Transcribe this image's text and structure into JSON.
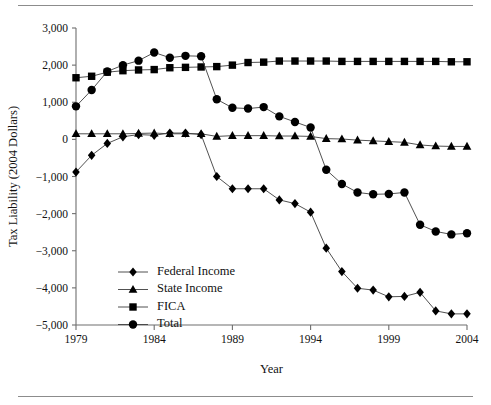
{
  "figure": {
    "kind": "line-chart-figure",
    "background_color": "#ffffff",
    "ink_color": "#000000",
    "line_color": "#3d3d3d",
    "axis_color": "#6e6e6e",
    "rule_color": "#8c8c8c"
  },
  "chart_data": {
    "type": "line",
    "title": "",
    "xlabel": "Year",
    "ylabel": "Tax Liability (2004 Dollars)",
    "xlim": [
      1979,
      2004
    ],
    "ylim": [
      -5000,
      3000
    ],
    "xticks": [
      1979,
      1984,
      1989,
      1994,
      1999,
      2004
    ],
    "xticklabels": [
      "1979",
      "1984",
      "1989",
      "1994",
      "1999",
      "2004"
    ],
    "yticks": [
      -5000,
      -4000,
      -3000,
      -2000,
      -1000,
      0,
      1000,
      2000,
      3000
    ],
    "yticklabels": [
      "−5,000",
      "−4,000",
      "−3,000",
      "−2,000",
      "−1,000",
      "0",
      "1,000",
      "2,000",
      "3,000"
    ],
    "grid": false,
    "legend_position": "lower-left-inside",
    "x": [
      1979,
      1980,
      1981,
      1982,
      1983,
      1984,
      1985,
      1986,
      1987,
      1988,
      1989,
      1990,
      1991,
      1992,
      1993,
      1994,
      1995,
      1996,
      1997,
      1998,
      1999,
      2000,
      2001,
      2002,
      2003,
      2004
    ],
    "series": [
      {
        "name": "Federal Income",
        "marker": "diamond",
        "values": [
          -880,
          -430,
          -110,
          70,
          130,
          110,
          170,
          170,
          130,
          -1000,
          -1330,
          -1330,
          -1330,
          -1630,
          -1730,
          -1960,
          -2930,
          -3560,
          -4010,
          -4060,
          -4240,
          -4230,
          -4120,
          -4620,
          -4700,
          -4700
        ]
      },
      {
        "name": "State Income",
        "marker": "triangle",
        "values": [
          150,
          150,
          150,
          150,
          160,
          170,
          150,
          150,
          150,
          80,
          100,
          100,
          100,
          90,
          90,
          80,
          20,
          10,
          -20,
          -40,
          -60,
          -80,
          -150,
          -180,
          -190,
          -190
        ]
      },
      {
        "name": "FICA",
        "marker": "square",
        "values": [
          1660,
          1700,
          1810,
          1850,
          1870,
          1880,
          1930,
          1940,
          1950,
          1960,
          2000,
          2070,
          2080,
          2110,
          2110,
          2110,
          2110,
          2100,
          2100,
          2100,
          2100,
          2100,
          2100,
          2100,
          2090,
          2090
        ]
      },
      {
        "name": "Total",
        "marker": "circle",
        "values": [
          890,
          1330,
          1830,
          2000,
          2120,
          2340,
          2200,
          2250,
          2240,
          1080,
          850,
          830,
          870,
          620,
          470,
          320,
          -820,
          -1200,
          -1430,
          -1480,
          -1470,
          -1430,
          -2300,
          -2480,
          -2560,
          -2530
        ]
      }
    ]
  },
  "legend": {
    "entries": [
      {
        "label": "Federal Income",
        "marker": "diamond"
      },
      {
        "label": "State Income",
        "marker": "triangle"
      },
      {
        "label": "FICA",
        "marker": "square"
      },
      {
        "label": "Total",
        "marker": "circle"
      }
    ]
  }
}
